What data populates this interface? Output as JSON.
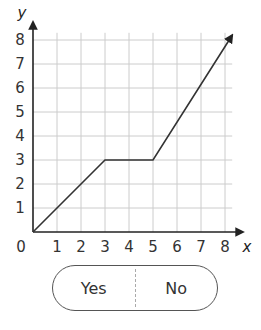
{
  "chart_data": {
    "type": "line",
    "title": "",
    "xlabel": "x",
    "ylabel": "y",
    "x": [
      0,
      3,
      5,
      8.3
    ],
    "y": [
      0,
      3,
      3,
      8.2
    ],
    "xlim": [
      0,
      8.3
    ],
    "ylim": [
      0,
      8.3
    ],
    "xticks": [
      "0",
      "1",
      "2",
      "3",
      "4",
      "5",
      "6",
      "7",
      "8"
    ],
    "yticks": [
      "1",
      "2",
      "3",
      "4",
      "5",
      "6",
      "7",
      "8"
    ],
    "grid": true,
    "end_arrow": true
  },
  "choices": {
    "yes_label": "Yes",
    "no_label": "No"
  },
  "colors": {
    "grid": "#cccccc",
    "axis": "#222222",
    "line": "#333333"
  }
}
